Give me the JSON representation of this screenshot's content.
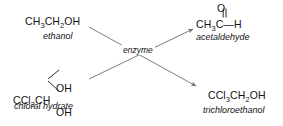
{
  "diagram": {
    "type": "reaction-scheme",
    "background_color": "#ffffff",
    "line_color": "#6e6e6e",
    "text_color": "#141414"
  },
  "reactants": [
    {
      "id": "ethanol",
      "formula_parts": {
        "a": "CH",
        "sub1": "3",
        "b": "CH",
        "sub2": "2",
        "c": "OH"
      },
      "name": "ethanol"
    },
    {
      "id": "chloral-hydrate",
      "core_parts": {
        "a": "CCl",
        "sub1": "3",
        "b": "CH"
      },
      "substituent_top": "OH",
      "substituent_bottom": "OH",
      "name": "chloral hydrate"
    }
  ],
  "products": [
    {
      "id": "acetaldehyde",
      "carbonyl_oxygen": "O",
      "base_parts": {
        "a": "CH",
        "sub1": "3",
        "b": "C",
        "c": "H",
        "dash": "—"
      },
      "name": "acetaldehyde"
    },
    {
      "id": "trichloroethanol",
      "formula_parts": {
        "a": "CCl",
        "sub1": "3",
        "b": "CH",
        "sub2": "2",
        "c": "OH"
      },
      "name": "trichloroethanol"
    }
  ],
  "catalyst": {
    "label": "enzyme"
  },
  "arrows": [
    {
      "id": "ethanol-to-acetaldehyde",
      "from": "ethanol",
      "to": "acetaldehyde",
      "direction": "up-right"
    },
    {
      "id": "chloral-to-trichloroethanol",
      "from": "chloral-hydrate",
      "to": "trichloroethanol",
      "direction": "down-right"
    }
  ]
}
